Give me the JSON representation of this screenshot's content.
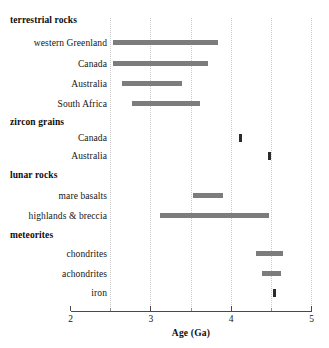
{
  "chart_data": {
    "type": "bar",
    "title": "",
    "subtitle": "",
    "xlabel": "Age (Ga)",
    "ylabel": "",
    "xlim": [
      2,
      5
    ],
    "xticks": [
      2,
      3,
      4,
      5
    ],
    "xtick_labels": [
      "2",
      "3",
      "4",
      "5"
    ],
    "xminor_ticks": [
      2.5,
      3.5,
      4.5
    ],
    "grid": "vertical dotted gridlines every 0.5 Ga",
    "legend": "none",
    "orientation": "horizontal",
    "bar_color": "#7c7c7c",
    "marker_color": "#2b2b2b",
    "note": "Horizontal range bars showing the span of measured ages (Ga) for each sample category.",
    "groups": [
      {
        "name": "terrestrial rocks",
        "items": [
          {
            "label": "western Greenland",
            "start": 2.53,
            "end": 3.84
          },
          {
            "label": "Canada",
            "start": 2.53,
            "end": 3.71
          },
          {
            "label": "Australia",
            "start": 2.64,
            "end": 3.39
          },
          {
            "label": "South Africa",
            "start": 2.76,
            "end": 3.61
          }
        ]
      },
      {
        "name": "zircon grains",
        "items": [
          {
            "label": "Canada",
            "start": 4.1,
            "end": 4.14
          },
          {
            "label": "Australia",
            "start": 4.46,
            "end": 4.49
          }
        ]
      },
      {
        "name": "lunar rocks",
        "items": [
          {
            "label": "mare basalts",
            "start": 3.52,
            "end": 3.9
          },
          {
            "label": "highlands & breccia",
            "start": 3.12,
            "end": 4.47
          }
        ]
      },
      {
        "name": "meteorites",
        "items": [
          {
            "label": "chondrites",
            "start": 4.31,
            "end": 4.64
          },
          {
            "label": "achondrites",
            "start": 4.39,
            "end": 4.62
          },
          {
            "label": "iron",
            "start": 4.52,
            "end": 4.55
          }
        ]
      }
    ]
  },
  "rows": [
    {
      "kind": "group",
      "text": "terrestrial rocks",
      "y": 15
    },
    {
      "kind": "item",
      "text": "western Greenland",
      "y": 38,
      "start": 2.53,
      "end": 3.84
    },
    {
      "kind": "item",
      "text": "Canada",
      "y": 59,
      "start": 2.53,
      "end": 3.71
    },
    {
      "kind": "item",
      "text": "Australia",
      "y": 79,
      "start": 2.64,
      "end": 3.39
    },
    {
      "kind": "item",
      "text": "South Africa",
      "y": 99,
      "start": 2.76,
      "end": 3.61
    },
    {
      "kind": "group",
      "text": "zircon grains",
      "y": 117
    },
    {
      "kind": "item",
      "text": "Canada",
      "y": 133,
      "start": 4.1,
      "end": 4.14
    },
    {
      "kind": "item",
      "text": "Australia",
      "y": 151,
      "start": 4.46,
      "end": 4.49
    },
    {
      "kind": "group",
      "text": "lunar rocks",
      "y": 170
    },
    {
      "kind": "item",
      "text": "mare basalts",
      "y": 191,
      "start": 3.52,
      "end": 3.9
    },
    {
      "kind": "item",
      "text": "highlands & breccia",
      "y": 211,
      "start": 3.12,
      "end": 4.47
    },
    {
      "kind": "group",
      "text": "meteorites",
      "y": 230
    },
    {
      "kind": "item",
      "text": "chondrites",
      "y": 249,
      "start": 4.31,
      "end": 4.64
    },
    {
      "kind": "item",
      "text": "achondrites",
      "y": 269,
      "start": 4.39,
      "end": 4.62
    },
    {
      "kind": "item",
      "text": "iron",
      "y": 288,
      "start": 4.52,
      "end": 4.55
    }
  ],
  "axis": {
    "title": "Age (Ga)",
    "labels": [
      "2",
      "3",
      "4",
      "5"
    ],
    "values": [
      2,
      3,
      4,
      5
    ],
    "minor": [
      2.5,
      3.5,
      4.5
    ]
  }
}
